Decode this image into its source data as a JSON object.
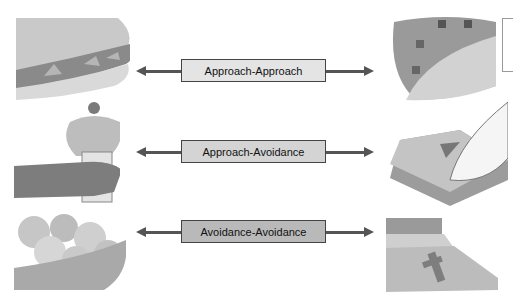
{
  "diagram": {
    "rows": [
      {
        "label": "Approach-Approach",
        "left_image": "sandwich-icon",
        "right_image": "taco-icon",
        "box_color": "#e4e4e4"
      },
      {
        "label": "Approach-Avoidance",
        "left_image": "ice-cream-cone-icon",
        "right_image": "scale-foot-icon",
        "box_color": "#d4d4d4"
      },
      {
        "label": "Avoidance-Avoidance",
        "left_image": "bowl-of-food-icon",
        "right_image": "bed-cross-icon",
        "box_color": "#b9b9b9"
      }
    ]
  }
}
